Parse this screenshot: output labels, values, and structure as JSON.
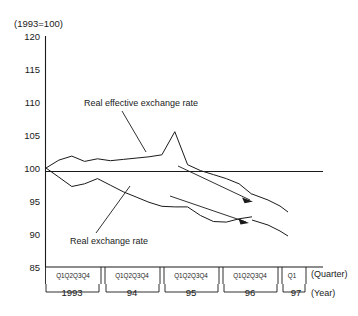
{
  "chart_data": {
    "type": "line",
    "title": "",
    "subtitle": "",
    "unit_note": "(1993=100)",
    "xlabel_quarter": "(Quarter)",
    "xlabel_year": "(Year)",
    "ylabel": "",
    "ylim": [
      85,
      120
    ],
    "yticks": [
      120,
      115,
      110,
      105,
      100,
      95,
      90,
      85
    ],
    "ytick_labels": [
      "120",
      "115",
      "110",
      "105",
      "100",
      "95",
      "90",
      "85"
    ],
    "grid": false,
    "legend_position": "inline-annotation",
    "reference_line": 100,
    "x_categories": [
      "1993Q1",
      "1993Q2",
      "1993Q3",
      "1993Q4",
      "94Q1",
      "94Q2",
      "94Q3",
      "94Q4",
      "95Q1",
      "95Q2",
      "95Q3",
      "95Q4",
      "96Q1",
      "96Q2",
      "96Q3",
      "96Q4",
      "97Q1"
    ],
    "quarter_tick_label": "Q1Q2Q3Q4",
    "quarter_tick_label_last": "Q1",
    "year_groups": [
      {
        "label": "1993",
        "quarters": [
          "Q1",
          "Q2",
          "Q3",
          "Q4"
        ]
      },
      {
        "label": "94",
        "quarters": [
          "Q1",
          "Q2",
          "Q3",
          "Q4"
        ]
      },
      {
        "label": "95",
        "quarters": [
          "Q1",
          "Q2",
          "Q3",
          "Q4"
        ]
      },
      {
        "label": "96",
        "quarters": [
          "Q1",
          "Q2",
          "Q3",
          "Q4"
        ]
      },
      {
        "label": "97",
        "quarters": [
          "Q1"
        ]
      }
    ],
    "series": [
      {
        "name": "Real effective exchange rate",
        "values": [
          100.0,
          101.2,
          101.8,
          101.0,
          101.4,
          101.1,
          101.3,
          101.5,
          101.7,
          102.0,
          105.5,
          100.5,
          99.6,
          99.0,
          98.4,
          97.6,
          96.0
        ]
      },
      {
        "name": "Real exchange rate",
        "values": [
          100.0,
          98.6,
          97.2,
          97.6,
          98.4,
          97.4,
          96.4,
          95.6,
          94.8,
          94.2,
          94.1,
          94.1,
          92.8,
          91.9,
          91.8,
          92.3,
          92.6
        ]
      }
    ],
    "annotations": [
      {
        "name": "real-effective-exchange-rate-label",
        "text": "Real effective exchange rate"
      },
      {
        "name": "real-exchange-rate-label",
        "text": "Real exchange rate"
      }
    ]
  },
  "colors": {
    "ink": "#1a1a1a",
    "background": "#ffffff"
  }
}
